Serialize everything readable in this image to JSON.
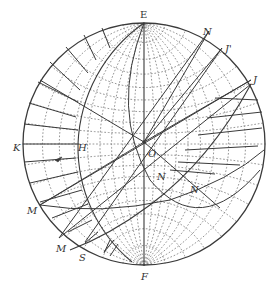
{
  "figure": {
    "type": "stereonet",
    "primitive": {
      "cx": 144,
      "cy": 144,
      "r": 121
    },
    "colors": {
      "ink": "#3a3a3a",
      "dots": "#8a8a8a",
      "background": "#ffffff"
    }
  },
  "labels": [
    {
      "id": "E",
      "text": "E",
      "x": 140,
      "y": 10,
      "italic": false
    },
    {
      "id": "N-top",
      "text": "N",
      "x": 203,
      "y": 27,
      "italic": true
    },
    {
      "id": "J-upper",
      "text": "J'",
      "x": 225,
      "y": 44,
      "italic": true
    },
    {
      "id": "J",
      "text": "J",
      "x": 253,
      "y": 75,
      "italic": true
    },
    {
      "id": "K",
      "text": "K",
      "x": 13,
      "y": 143,
      "italic": true
    },
    {
      "id": "H",
      "text": "H",
      "x": 78,
      "y": 143,
      "italic": true
    },
    {
      "id": "O",
      "text": "O",
      "x": 148,
      "y": 149,
      "italic": true
    },
    {
      "id": "N-center",
      "text": "N",
      "x": 157,
      "y": 172,
      "italic": true
    },
    {
      "id": "N-right",
      "text": "N",
      "x": 190,
      "y": 185,
      "italic": true
    },
    {
      "id": "M-upper",
      "text": "M",
      "x": 27,
      "y": 206,
      "italic": true
    },
    {
      "id": "M-lower",
      "text": "M",
      "x": 56,
      "y": 244,
      "italic": true
    },
    {
      "id": "S",
      "text": "S",
      "x": 79,
      "y": 253,
      "italic": true
    },
    {
      "id": "F",
      "text": "F",
      "x": 141,
      "y": 272,
      "italic": true
    }
  ]
}
